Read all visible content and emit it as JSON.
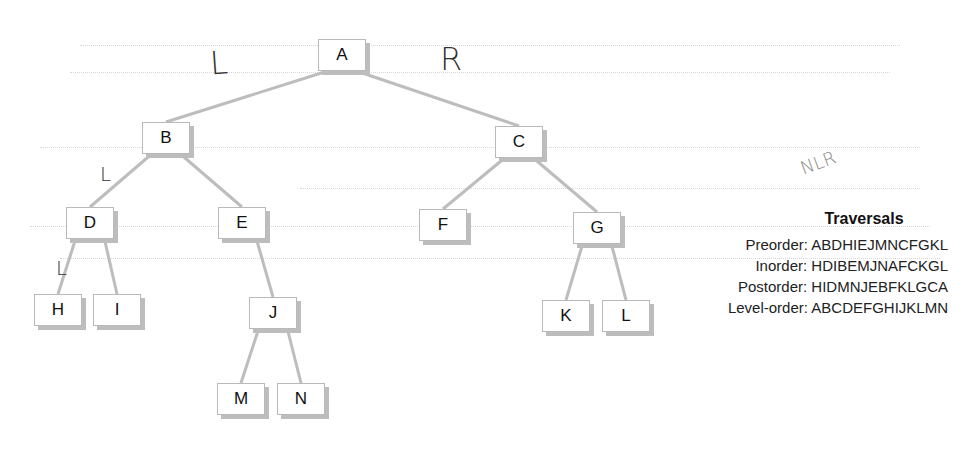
{
  "tree": {
    "nodes": [
      {
        "id": "A",
        "label": "A",
        "x": 318,
        "y": 39
      },
      {
        "id": "B",
        "label": "B",
        "x": 142,
        "y": 122
      },
      {
        "id": "C",
        "label": "C",
        "x": 495,
        "y": 126
      },
      {
        "id": "D",
        "label": "D",
        "x": 66,
        "y": 207
      },
      {
        "id": "E",
        "label": "E",
        "x": 218,
        "y": 207
      },
      {
        "id": "F",
        "label": "F",
        "x": 419,
        "y": 209
      },
      {
        "id": "G",
        "label": "G",
        "x": 573,
        "y": 212
      },
      {
        "id": "H",
        "label": "H",
        "x": 34,
        "y": 294
      },
      {
        "id": "I",
        "label": "I",
        "x": 93,
        "y": 294
      },
      {
        "id": "J",
        "label": "J",
        "x": 249,
        "y": 297
      },
      {
        "id": "K",
        "label": "K",
        "x": 542,
        "y": 300
      },
      {
        "id": "L",
        "label": "L",
        "x": 602,
        "y": 300
      },
      {
        "id": "M",
        "label": "M",
        "x": 217,
        "y": 383
      },
      {
        "id": "N",
        "label": "N",
        "x": 277,
        "y": 383
      }
    ],
    "edges": [
      [
        "A",
        "B"
      ],
      [
        "A",
        "C"
      ],
      [
        "B",
        "D"
      ],
      [
        "B",
        "E"
      ],
      [
        "C",
        "F"
      ],
      [
        "C",
        "G"
      ],
      [
        "D",
        "H"
      ],
      [
        "D",
        "I"
      ],
      [
        "E",
        "J"
      ],
      [
        "G",
        "K"
      ],
      [
        "G",
        "L"
      ],
      [
        "J",
        "M"
      ],
      [
        "J",
        "N"
      ]
    ]
  },
  "annotations": {
    "left_mark": "L",
    "right_mark": "R",
    "b_left_mark": "L",
    "d_left_mark": "L",
    "nlr_note": "NLR"
  },
  "traversals": {
    "title": "Traversals",
    "rows": [
      {
        "label": "Preorder:",
        "value": "ABDHIEJMNCFGKL"
      },
      {
        "label": "Inorder:",
        "value": "HDIBEMJNAFCKGL"
      },
      {
        "label": "Postorder:",
        "value": "HIDMNJEBFKLGCA"
      },
      {
        "label": "Level-order:",
        "value": "ABCDEFGHIJKLMN"
      }
    ]
  }
}
